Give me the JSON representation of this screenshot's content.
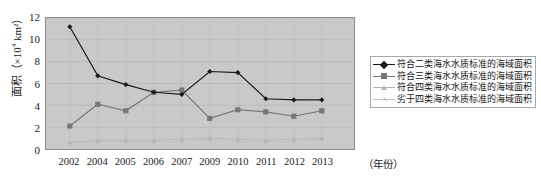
{
  "chart_data": {
    "type": "line",
    "title": "",
    "xlabel": "（年份）",
    "ylabel": "面积（×10⁴ km²）",
    "categories": [
      "2002",
      "2004",
      "2005",
      "2006",
      "2007",
      "2009",
      "2010",
      "2011",
      "2012",
      "2013"
    ],
    "ylim": [
      0,
      12
    ],
    "yticks": [
      12,
      10,
      8,
      6,
      4,
      2,
      0
    ],
    "grid": true,
    "legend_position": "right",
    "plot_background": "#c9c9c9",
    "series": [
      {
        "name": "符合二类海水水质标准的海域面积",
        "color": "#1a1a1a",
        "marker": "diamond",
        "values": [
          11.2,
          6.7,
          5.9,
          5.2,
          5.0,
          7.1,
          7.0,
          4.6,
          4.5,
          4.5
        ]
      },
      {
        "name": "符合三类海水水质标准的海域面积",
        "color": "#777777",
        "marker": "square",
        "values": [
          2.1,
          4.1,
          3.5,
          5.2,
          5.4,
          2.8,
          3.6,
          3.4,
          3.0,
          3.5
        ]
      },
      {
        "name": "符合四类海水水质标准的海域面积",
        "color": "#b4b4b4",
        "marker": "triangle",
        "values": [
          0.6,
          0.8,
          0.8,
          0.8,
          0.9,
          1.0,
          0.9,
          0.8,
          0.9,
          1.0
        ]
      },
      {
        "name": "劣于四类海水水质标准的海域面积",
        "color": "#c0c0c0",
        "marker": "cross",
        "values": [
          0.5,
          0.7,
          0.7,
          0.6,
          0.7,
          0.8,
          0.7,
          0.6,
          0.7,
          0.8
        ]
      }
    ]
  },
  "axis": {
    "y_label_text": "面积（×10",
    "y_label_sup": "4",
    "y_label_tail": " km²）",
    "x_unit": "（年份）"
  }
}
